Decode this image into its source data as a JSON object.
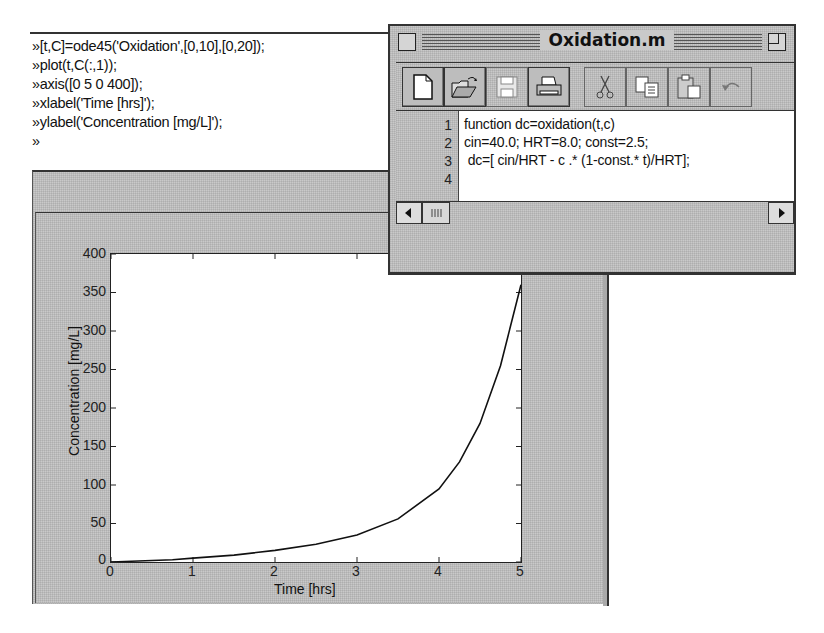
{
  "command_window": {
    "prompt": "»",
    "lines": [
      "»[t,C]=ode45('Oxidation',[0,10],[0,20]);",
      "»plot(t,C(:,1));",
      "»axis([0 5 0 400]);",
      "»xlabel('Time [hrs]');",
      "»ylabel('Concentration [mg/L]');",
      "»"
    ]
  },
  "figure_window": {
    "title": "Figure No. 1"
  },
  "editor_window": {
    "title": "Oxidation.m",
    "toolbar": [
      {
        "name": "new-file",
        "label": "New"
      },
      {
        "name": "open-file",
        "label": "Open"
      },
      {
        "name": "save",
        "label": "Save"
      },
      {
        "name": "print",
        "label": "Print"
      },
      {
        "name": "cut",
        "label": "Cut"
      },
      {
        "name": "copy",
        "label": "Copy"
      },
      {
        "name": "paste",
        "label": "Paste"
      },
      {
        "name": "undo",
        "label": "Undo"
      }
    ],
    "line_numbers": [
      "1",
      "2",
      "3",
      "4"
    ],
    "code_lines": [
      "function dc=oxidation(t,c)",
      "cin=40.0; HRT=8.0; const=2.5;",
      " dc=[ cin/HRT - c .* (1-const.* t)/HRT];",
      ""
    ]
  },
  "chart_data": {
    "type": "line",
    "title": "",
    "xlabel": "Time [hrs]",
    "ylabel": "Concentration [mg/L]",
    "xlim": [
      0,
      5
    ],
    "ylim": [
      0,
      400
    ],
    "x_ticks": [
      "0",
      "1",
      "2",
      "3",
      "4",
      "5"
    ],
    "y_ticks": [
      "0",
      "50",
      "100",
      "150",
      "200",
      "250",
      "300",
      "350",
      "400"
    ],
    "grid": false,
    "series": [
      {
        "name": "C(:,1)",
        "x": [
          0,
          0.25,
          0.5,
          0.75,
          1.0,
          1.5,
          2.0,
          2.5,
          3.0,
          3.5,
          4.0,
          4.25,
          4.5,
          4.75,
          5.0
        ],
        "y": [
          0,
          1,
          2,
          3,
          5,
          9,
          15,
          23,
          35,
          56,
          95,
          130,
          180,
          255,
          360
        ]
      }
    ]
  }
}
